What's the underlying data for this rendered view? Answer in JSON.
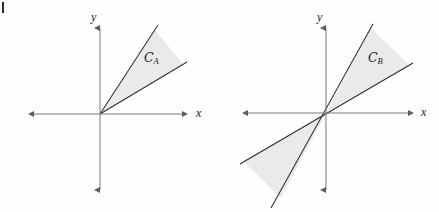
{
  "figure": {
    "background_color": "#fefefe",
    "axis_color": "#6e6e6e",
    "cone_line_color": "#2e2e2e",
    "cone_fill_color": "#eaeaea",
    "text_color": "#1b1b1b",
    "width": 439,
    "height": 212
  },
  "panels": [
    {
      "id": "panel-a",
      "name": "cone-a-diagram",
      "origin": {
        "x": 100,
        "y": 114
      },
      "axes": {
        "x": {
          "label": "x",
          "label_x": 196,
          "label_y": 107,
          "start_x": 14,
          "end_x": 190,
          "y": 114,
          "arrows": "both"
        },
        "y": {
          "label": "y",
          "label_x": 91,
          "label_y": 11,
          "start_y": 20,
          "end_y": 198,
          "x": 100,
          "arrows": "both"
        }
      },
      "cone": {
        "label": "C",
        "subscript": "A",
        "label_x": 144,
        "label_y": 52,
        "type": "single-cone",
        "apex": {
          "x": 100,
          "y": 114
        },
        "edges": [
          {
            "name": "upper-edge",
            "to": {
              "x": 158,
              "y": 25
            }
          },
          {
            "name": "lower-edge",
            "to": {
              "x": 187,
              "y": 62
            }
          }
        ],
        "fill_vertices": "100,114 155,30 183,64"
      }
    },
    {
      "id": "panel-b",
      "name": "cone-b-diagram",
      "origin": {
        "x": 326,
        "y": 113
      },
      "axes": {
        "x": {
          "label": "x",
          "label_x": 421,
          "label_y": 106,
          "start_x": 240,
          "end_x": 415,
          "y": 113,
          "arrows": "both"
        },
        "y": {
          "label": "y",
          "label_x": 317,
          "label_y": 11,
          "start_y": 20,
          "end_y": 198,
          "x": 326,
          "arrows": "both"
        }
      },
      "cone": {
        "label": "C",
        "subscript": "B",
        "label_x": 368,
        "label_y": 52,
        "type": "double-cone",
        "apex": {
          "x": 326,
          "y": 113
        },
        "edges": [
          {
            "name": "steep-edge-upper",
            "to": {
              "x": 373,
              "y": 24
            }
          },
          {
            "name": "shallow-edge-upper",
            "to": {
              "x": 413,
              "y": 63
            }
          },
          {
            "name": "steep-edge-lower",
            "to": {
              "x": 271,
              "y": 208
            }
          },
          {
            "name": "shallow-edge-lower",
            "to": {
              "x": 240,
              "y": 164
            }
          }
        ],
        "fill_vertices_upper": "326,113 371,28 409,65",
        "fill_vertices_lower": "326,113 281,198 243,161"
      }
    }
  ],
  "crop_mark": {
    "name": "crop-tick-mark",
    "x": 2,
    "y": 2,
    "width": 2,
    "height": 11
  }
}
